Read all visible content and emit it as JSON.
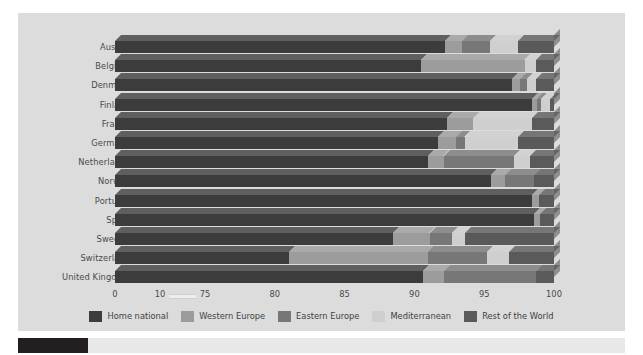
{
  "chart_data": {
    "type": "bar",
    "orientation": "horizontal",
    "stacked": true,
    "title": "",
    "subtitle": "",
    "xlabel": "",
    "ylabel": "",
    "grid": false,
    "legend_position": "bottom",
    "xlim": [
      0,
      100
    ],
    "axis_break": {
      "from": 10,
      "to": 75,
      "present": true
    },
    "tick_labels": [
      "0",
      "10",
      "75",
      "80",
      "85",
      "90",
      "95",
      "100"
    ],
    "tick_values": [
      0,
      10,
      75,
      80,
      85,
      90,
      95,
      100
    ],
    "categories": [
      "Austria",
      "Belgium",
      "Denmark",
      "Finland",
      "France",
      "Germany",
      "Netherlands",
      "Norway",
      "Portugal",
      "Spain",
      "Sweden",
      "Switzerland",
      "United Kingdom"
    ],
    "series": [
      {
        "name": "Home national",
        "color": "#3c3c3c",
        "values": [
          92.2,
          90.5,
          97.0,
          98.4,
          92.3,
          91.7,
          91.0,
          95.5,
          98.4,
          98.6,
          88.5,
          81.0,
          90.6
        ]
      },
      {
        "name": "Western Europe",
        "color": "#9c9c9c",
        "values": [
          1.2,
          7.4,
          0.6,
          0.4,
          1.9,
          1.3,
          1.1,
          1.0,
          0.5,
          0.4,
          2.6,
          10.0,
          1.5
        ]
      },
      {
        "name": "Eastern Europe",
        "color": "#777777",
        "values": [
          2.0,
          0.0,
          0.5,
          0.3,
          0.0,
          0.6,
          5.0,
          2.1,
          0.0,
          0.0,
          1.6,
          4.2,
          6.6
        ]
      },
      {
        "name": "Mediterranean",
        "color": "#cfcfcf",
        "values": [
          2.0,
          0.8,
          0.6,
          0.6,
          4.2,
          3.8,
          1.2,
          0.0,
          0.0,
          0.0,
          0.9,
          1.6,
          0.0
        ]
      },
      {
        "name": "Rest of the World",
        "color": "#5a5a5a",
        "values": [
          2.6,
          1.3,
          1.3,
          0.3,
          1.6,
          2.6,
          1.7,
          1.4,
          1.1,
          1.0,
          6.4,
          3.2,
          1.3
        ]
      }
    ]
  },
  "legend": {
    "items": [
      {
        "label": "Home national",
        "color": "#3c3c3c"
      },
      {
        "label": "Western Europe",
        "color": "#9c9c9c"
      },
      {
        "label": "Eastern Europe",
        "color": "#777777"
      },
      {
        "label": "Mediterranean",
        "color": "#cfcfcf"
      },
      {
        "label": "Rest of the World",
        "color": "#5a5a5a"
      }
    ]
  },
  "colors": {
    "figure_background": "#dcdcdc",
    "page_background": "#ffffff",
    "axis_text": "#4a4a4a",
    "footer_bar": "#231f20",
    "footer_strip": "#e8e8e8"
  }
}
